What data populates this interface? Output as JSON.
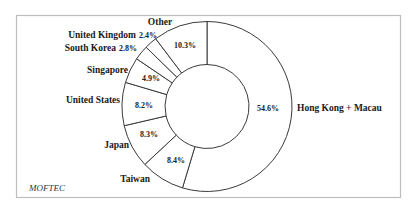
{
  "chart_data": {
    "type": "pie",
    "variant": "donut",
    "title": "",
    "source": "MOFTEC",
    "start_angle_deg": 0,
    "direction": "clockwise",
    "center": [
      207,
      106.5
    ],
    "outer_radius": 85,
    "inner_radius": 42,
    "slices": [
      {
        "label": "Hong Kong + Macau",
        "value": 54.6,
        "value_label": "54.6%",
        "label_pos": [
          297,
          111
        ],
        "label_anchor": "start",
        "pct_pos": [
          268,
          111
        ]
      },
      {
        "label": "Taiwan",
        "value": 8.4,
        "value_label": "8.4%",
        "label_pos": [
          150,
          182
        ],
        "label_anchor": "end",
        "pct_pos": [
          176,
          163
        ]
      },
      {
        "label": "Japan",
        "value": 8.3,
        "value_label": "8.3%",
        "label_pos": [
          129,
          148
        ],
        "label_anchor": "end",
        "pct_pos": [
          149,
          137
        ]
      },
      {
        "label": "United States",
        "value": 8.2,
        "value_label": "8.2%",
        "label_pos": [
          120,
          103
        ],
        "label_anchor": "end",
        "pct_pos": [
          144,
          108
        ]
      },
      {
        "label": "Singapore",
        "value": 4.9,
        "value_label": "4.9%",
        "label_pos": [
          128,
          73
        ],
        "label_anchor": "end",
        "pct_pos": [
          151,
          81
        ]
      },
      {
        "label": "South Korea",
        "value": 2.8,
        "value_label": "2.8%",
        "label_pos": [
          116,
          51
        ],
        "label_anchor": "end",
        "pct_inline": true
      },
      {
        "label": "United Kingdom",
        "value": 2.4,
        "value_label": "2.4%",
        "label_pos": [
          136,
          38
        ],
        "label_anchor": "end",
        "pct_inline": true
      },
      {
        "label": "Other",
        "value": 10.3,
        "value_label": "10.3%",
        "label_pos": [
          160,
          25
        ],
        "label_anchor": "middle",
        "pct_pos": [
          185,
          48
        ]
      }
    ],
    "legend": "none"
  },
  "source_label": "MOFTEC"
}
